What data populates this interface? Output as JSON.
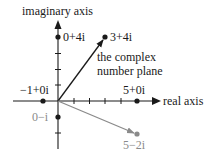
{
  "diagram": {
    "title": "the complex number plane",
    "note_line1": "the complex",
    "note_line2": "number plane",
    "axes": {
      "x_label": "real axis",
      "y_label": "imaginary axis"
    },
    "colors": {
      "main": "#1a1a1a",
      "secondary": "#8a8a8a"
    },
    "points": [
      {
        "label": "0+4i",
        "re": 0,
        "im": 4,
        "color": "#1a1a1a",
        "vector": false
      },
      {
        "label": "3+4i",
        "re": 3,
        "im": 4,
        "color": "#1a1a1a",
        "vector": true
      },
      {
        "label": "−1+0i",
        "re": -1,
        "im": 0,
        "color": "#1a1a1a",
        "vector": false
      },
      {
        "label": "5+0i",
        "re": 5,
        "im": 0,
        "color": "#1a1a1a",
        "vector": false
      },
      {
        "label": "0−i",
        "re": 0,
        "im": -1,
        "color": "#1a1a1a",
        "vector": false
      },
      {
        "label": "5−2i",
        "re": 5,
        "im": -2,
        "color": "#8a8a8a",
        "vector": true
      }
    ]
  }
}
